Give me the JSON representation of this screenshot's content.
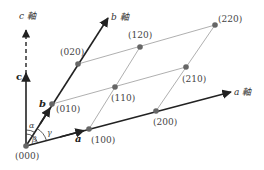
{
  "diagram": {
    "axes": {
      "a": {
        "label": "a 軸",
        "vector_label": "a"
      },
      "b": {
        "label": "b 軸",
        "vector_label": "b"
      },
      "c": {
        "label": "c 軸",
        "vector_label": "c"
      }
    },
    "angles": {
      "alpha": "α",
      "beta": "β",
      "gamma": "γ"
    },
    "lattice_points": [
      {
        "label": "(000)"
      },
      {
        "label": "(100)"
      },
      {
        "label": "(200)"
      },
      {
        "label": "(010)"
      },
      {
        "label": "(110)"
      },
      {
        "label": "(210)"
      },
      {
        "label": "(020)"
      },
      {
        "label": "(120)"
      },
      {
        "label": "(220)"
      }
    ],
    "colors": {
      "axis": "#222222",
      "grid_line": "#999999",
      "point": "#666666"
    }
  }
}
